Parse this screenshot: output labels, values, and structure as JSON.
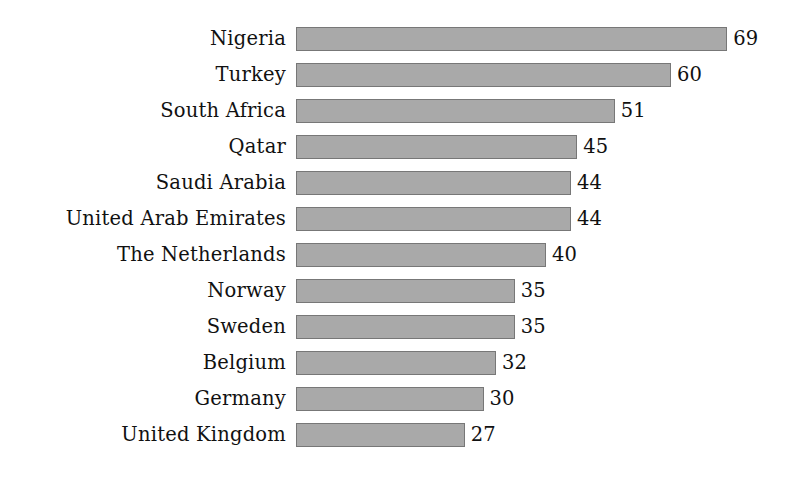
{
  "chart_data": {
    "type": "bar",
    "orientation": "horizontal",
    "title": "",
    "subtitle": "",
    "xlabel": "",
    "ylabel": "",
    "grid": false,
    "legend": null,
    "axis_visible": false,
    "value_labels": true,
    "xlim": [
      0,
      69
    ],
    "categories": [
      "Nigeria",
      "Turkey",
      "South Africa",
      "Qatar",
      "Saudi Arabia",
      "United Arab Emirates",
      "The Netherlands",
      "Norway",
      "Sweden",
      "Belgium",
      "Germany",
      "United Kingdom"
    ],
    "values": [
      69,
      60,
      51,
      45,
      44,
      44,
      40,
      35,
      35,
      32,
      30,
      27
    ],
    "bars": [
      {
        "label": "Nigeria",
        "value": 69
      },
      {
        "label": "Turkey",
        "value": 60
      },
      {
        "label": "South Africa",
        "value": 51
      },
      {
        "label": "Qatar",
        "value": 45
      },
      {
        "label": "Saudi Arabia",
        "value": 44
      },
      {
        "label": "United Arab Emirates",
        "value": 44
      },
      {
        "label": "The Netherlands",
        "value": 40
      },
      {
        "label": "Norway",
        "value": 35
      },
      {
        "label": "Sweden",
        "value": 35
      },
      {
        "label": "Belgium",
        "value": 32
      },
      {
        "label": "Germany",
        "value": 30
      },
      {
        "label": "United Kingdom",
        "value": 27
      }
    ],
    "colors": {
      "bar_fill": "#a9a9a9",
      "bar_border": "#777777",
      "text": "#111111",
      "background": "#ffffff"
    }
  },
  "layout": {
    "label_right_edge_px": 286,
    "bar_left_px": 296,
    "px_per_unit": 6.25,
    "row_height_px": 24,
    "row_pitch_px": 36,
    "first_row_top_px": 27
  }
}
